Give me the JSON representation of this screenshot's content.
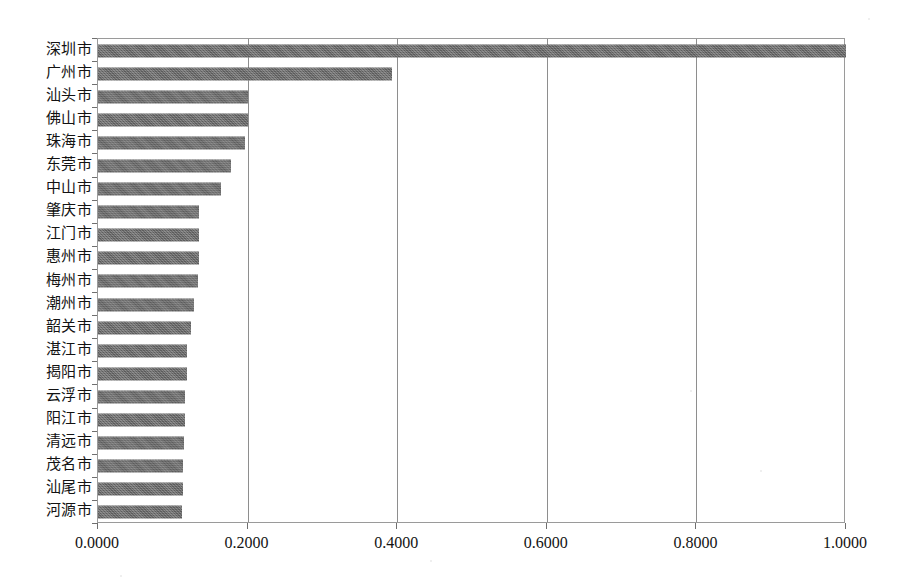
{
  "chart_data": {
    "type": "bar",
    "orientation": "horizontal",
    "title": "",
    "subtitle": "",
    "xlabel": "",
    "ylabel": "",
    "xlim": [
      0.0,
      1.0
    ],
    "xticks": [
      0.0,
      0.2,
      0.4,
      0.6,
      0.8,
      1.0
    ],
    "xtick_labels": [
      "0.0000",
      "0.2000",
      "0.4000",
      "0.6000",
      "0.8000",
      "1.0000"
    ],
    "grid": "vertical-only",
    "legend": "none",
    "bar_color": "#6d6d6d",
    "categories": [
      "深圳市",
      "广州市",
      "汕头市",
      "佛山市",
      "珠海市",
      "东莞市",
      "中山市",
      "肇庆市",
      "江门市",
      "惠州市",
      "梅州市",
      "潮州市",
      "韶关市",
      "湛江市",
      "揭阳市",
      "云浮市",
      "阳江市",
      "清远市",
      "茂名市",
      "汕尾市",
      "河源市"
    ],
    "values": [
      1.0,
      0.393,
      0.201,
      0.2,
      0.197,
      0.178,
      0.165,
      0.1355,
      0.135,
      0.1345,
      0.134,
      0.129,
      0.124,
      0.119,
      0.1185,
      0.1165,
      0.116,
      0.115,
      0.114,
      0.113,
      0.112
    ]
  }
}
